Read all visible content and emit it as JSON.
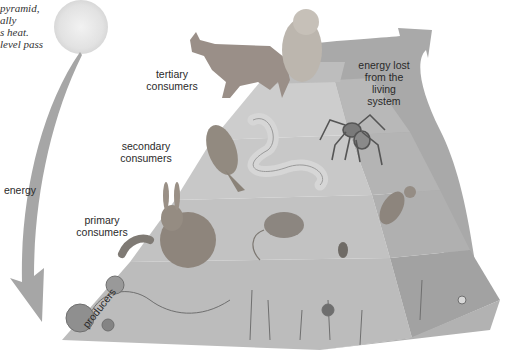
{
  "caption_fragment": [
    "pyramid,",
    "ally",
    "s heat.",
    "level pass"
  ],
  "labels": {
    "tertiary": [
      "tertiary",
      "consumers"
    ],
    "secondary": [
      "secondary",
      "consumers"
    ],
    "primary": [
      "primary",
      "consumers"
    ],
    "producers": "producers",
    "energy": "energy",
    "energy_lost": [
      "energy lost",
      "from the",
      "living",
      "system"
    ]
  },
  "levels": [
    {
      "name": "producers",
      "organisms": [
        "grape vine",
        "flowers",
        "grass",
        "strawberry",
        "weeds"
      ]
    },
    {
      "name": "primary consumers",
      "organisms": [
        "caterpillar",
        "rabbit",
        "mouse",
        "beetle",
        "small bird"
      ]
    },
    {
      "name": "secondary consumers",
      "organisms": [
        "sparrow",
        "snake",
        "spider"
      ]
    },
    {
      "name": "tertiary consumers",
      "organisms": [
        "wolf",
        "owl"
      ]
    }
  ],
  "colors": {
    "pyramid_light": "#c4c4c4",
    "pyramid_mid": "#b0b0b0",
    "pyramid_dark": "#9c9c9c",
    "arrow": "#a8a8a8",
    "sun": "#e4e4e4"
  }
}
